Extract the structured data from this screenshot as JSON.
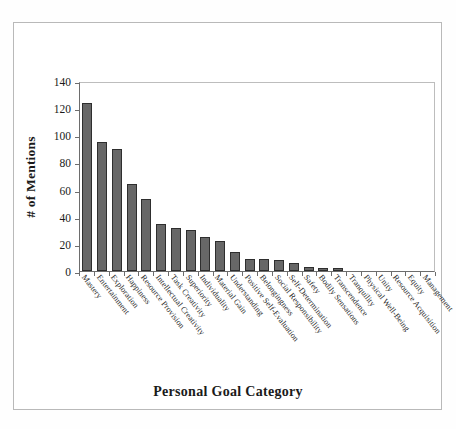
{
  "chart_data": {
    "type": "bar",
    "title": "",
    "xlabel": "Personal Goal Category",
    "ylabel": "# of Mentions",
    "ylim": [
      0,
      140
    ],
    "yticks": [
      0,
      20,
      40,
      60,
      80,
      100,
      120,
      140
    ],
    "grid": false,
    "legend": null,
    "bar_color": "#676767",
    "bar_edge_color": "#2e2e2e",
    "axis_color": "#6d6d6d",
    "categories": [
      "Mastery",
      "Entertainment",
      "Exploration",
      "Happiness",
      "Resource Provision",
      "Intellectual Creativity",
      "Task Creativity",
      "Superiority",
      "Individuality",
      "Material Gain",
      "Understanding",
      "Positive Self-Evaluation",
      "Belongingness",
      "Social Responsibility",
      "Self-Determination",
      "Safety",
      "Bodily Sensations",
      "Transcendence",
      "Tranquility",
      "Physical Well-Being",
      "Unity",
      "Resource Acquisition",
      "Equity",
      "Management"
    ],
    "values": [
      124,
      95,
      90,
      64,
      53,
      35,
      32,
      30,
      25,
      22,
      14,
      9,
      9,
      8,
      6,
      3,
      2,
      2,
      0,
      0,
      0,
      0,
      0,
      0
    ]
  }
}
